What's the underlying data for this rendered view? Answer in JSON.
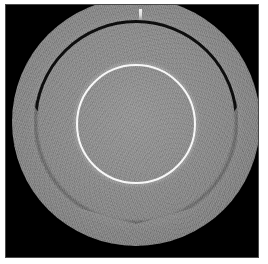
{
  "image": {
    "kind": "grayscale-tomographic-scan",
    "title": "Axial grayscale scan of concentric circular phantom",
    "background_color": "#000000",
    "paper_margin_color": "#ffffff",
    "frame_border_color": "#4a4a4a",
    "width_px": 268,
    "height_px": 264
  },
  "features": [
    {
      "name": "main-disk",
      "label": "Large gray circular disk",
      "shape": "circle",
      "center_px": [
        135,
        121
      ],
      "radius_px": 124,
      "fill_color": "#8a8a8a",
      "edge_color": "#5f5f5f"
    },
    {
      "name": "outer-dark-ring",
      "label": "Outer dark annular groove (open arc)",
      "shape": "arc",
      "center_px": [
        135,
        121
      ],
      "radius_px": 102,
      "stroke_color": "#0c0c0c",
      "stroke_width_px": 3,
      "arc_span_degrees": 250,
      "arc_opening": "bottom"
    },
    {
      "name": "inner-bright-ring",
      "label": "Bright white inner circle",
      "shape": "circle",
      "center_px": [
        135,
        123
      ],
      "radius_px": 60,
      "stroke_color": "#f8f8f8",
      "stroke_width_px": 2
    },
    {
      "name": "top-marker",
      "label": "Bright fiducial tick marker at top",
      "shape": "rect",
      "position_px": [
        133,
        4
      ],
      "size_px": [
        3,
        11
      ],
      "color": "#f2f2f2"
    }
  ],
  "texture": {
    "name": "speckle-noise",
    "description": "Fine granular speckle noise across the disk interior",
    "opacity": 0.3
  },
  "palette": {
    "black": "#000000",
    "disk_gray": "#8a8a8a",
    "dark_ring": "#0c0c0c",
    "bright_ring": "#f8f8f8",
    "white": "#ffffff"
  }
}
